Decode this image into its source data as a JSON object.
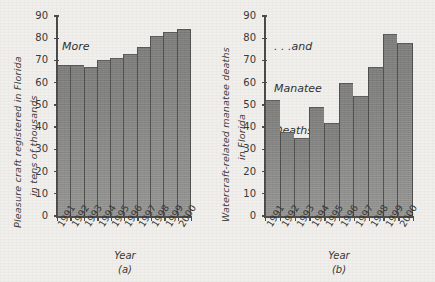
{
  "figure": {
    "background_color": "#f1efec",
    "bar_color": "#8a8a88",
    "axis_color": "#4a4845"
  },
  "panel_a": {
    "caption": "(a)",
    "annotation_lines": [
      "More",
      "Pleasure",
      "Boats . . ."
    ],
    "ylabel_line1": "Pleasure craft registered in Florida",
    "ylabel_line2": "in tens of thousands",
    "xlabel": "Year",
    "yticks": [
      "0",
      "10",
      "20",
      "30",
      "40",
      "50",
      "60",
      "70",
      "80",
      "90"
    ]
  },
  "panel_b": {
    "caption": "(b)",
    "annotation_lines": [
      ". . .and",
      "Manatee",
      "Deaths"
    ],
    "ylabel_line1": "Watercraft-related manatee deaths",
    "ylabel_line2": "in Florida",
    "xlabel": "Year",
    "yticks": [
      "0",
      "10",
      "20",
      "30",
      "40",
      "50",
      "60",
      "70",
      "80",
      "90"
    ]
  },
  "chart_data": [
    {
      "type": "bar",
      "title": "More Pleasure Boats . . .",
      "panel": "(a)",
      "categories": [
        "1991",
        "1992",
        "1993",
        "1994",
        "1995",
        "1996",
        "1997",
        "1998",
        "1999",
        "2000"
      ],
      "values": [
        68,
        68,
        67,
        70,
        71,
        73,
        76,
        81,
        83,
        84
      ],
      "xlabel": "Year",
      "ylabel": "Pleasure craft registered in Florida in tens of thousands",
      "ylim": [
        0,
        90
      ],
      "ytick_step": 10,
      "grid": false,
      "legend": "none"
    },
    {
      "type": "bar",
      "title": ". . .and Manatee Deaths",
      "panel": "(b)",
      "categories": [
        "1991",
        "1992",
        "1993",
        "1994",
        "1995",
        "1996",
        "1997",
        "1998",
        "1999",
        "2000"
      ],
      "values": [
        52,
        38,
        35,
        49,
        42,
        60,
        54,
        67,
        82,
        78
      ],
      "xlabel": "Year",
      "ylabel": "Watercraft-related manatee deaths in Florida",
      "ylim": [
        0,
        90
      ],
      "ytick_step": 10,
      "grid": false,
      "legend": "none"
    }
  ]
}
